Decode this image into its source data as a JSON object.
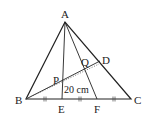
{
  "diagram": {
    "type": "triangle-geometry",
    "stroke_color": "#222222",
    "background": "#ffffff",
    "points": {
      "A": {
        "label": "A",
        "x": 65,
        "y": 22
      },
      "B": {
        "label": "B",
        "x": 26,
        "y": 99
      },
      "C": {
        "label": "C",
        "x": 131,
        "y": 99
      },
      "D": {
        "label": "D",
        "x": 100,
        "y": 61
      },
      "E": {
        "label": "E",
        "x": 62,
        "y": 99
      },
      "F": {
        "label": "F",
        "x": 97,
        "y": 99
      },
      "P": {
        "label": "P",
        "x": 62,
        "y": 80
      },
      "Q": {
        "label": "Q",
        "x": 85,
        "y": 69
      }
    },
    "segments": [
      "AB",
      "AC",
      "BC",
      "AE",
      "AF",
      "BD"
    ],
    "dotted_segments": [
      "B-D(dotted)"
    ],
    "equal_marks": "BE = EF = FC (double tick marks)",
    "measurement": {
      "label": "20 cm"
    }
  }
}
